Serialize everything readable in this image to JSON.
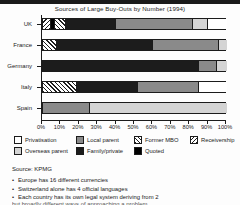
{
  "chart_data": {
    "type": "bar",
    "orientation": "horizontal",
    "stacked": true,
    "normalized_percent": true,
    "title": "Sources of Large Buy-Outs by Number (1994)",
    "xlabel": "",
    "ylabel": "",
    "xlim": [
      0,
      100
    ],
    "grid": false,
    "legend_position": "bottom",
    "categories": [
      "UK",
      "France",
      "Germany",
      "Italy",
      "Spain"
    ],
    "tick_labels": [
      "0%",
      "10%",
      "20%",
      "30%",
      "40%",
      "50%",
      "60%",
      "70%",
      "80%",
      "90%",
      "100%"
    ],
    "tick_values": [
      0,
      10,
      20,
      30,
      40,
      50,
      60,
      70,
      80,
      90,
      100
    ],
    "series": [
      {
        "name": "Receivership",
        "key": "recv",
        "fill": "hatch-back",
        "values": [
          4,
          0,
          0,
          0,
          0
        ]
      },
      {
        "name": "Quoted",
        "key": "quoted",
        "fill": "#000000",
        "values": [
          2,
          0,
          0,
          0,
          0
        ]
      },
      {
        "name": "Former MBO",
        "key": "mbo",
        "fill": "hatch-forward",
        "values": [
          6,
          7,
          0,
          18,
          0
        ]
      },
      {
        "name": "Family/private",
        "key": "fam",
        "fill": "#1c1c1c",
        "values": [
          27,
          52,
          84,
          33,
          0
        ]
      },
      {
        "name": "Local parent",
        "key": "local",
        "fill": "#8a8a8a",
        "values": [
          42,
          36,
          10,
          33,
          25
        ]
      },
      {
        "name": "Overseas parent",
        "key": "over",
        "fill": "#d4d4d4",
        "values": [
          8,
          5,
          6,
          0,
          75
        ]
      },
      {
        "name": "Privatisation",
        "key": "priv",
        "fill": "#ffffff",
        "values": [
          11,
          0,
          0,
          16,
          0
        ]
      }
    ],
    "bars": [
      {
        "category": "UK",
        "segments": [
          {
            "key": "recv",
            "label": "Receivership",
            "start": 0,
            "end": 4
          },
          {
            "key": "quoted",
            "label": "Quoted",
            "start": 4,
            "end": 6
          },
          {
            "key": "mbo",
            "label": "Former MBO",
            "start": 6,
            "end": 12
          },
          {
            "key": "fam",
            "label": "Family/private",
            "start": 12,
            "end": 39
          },
          {
            "key": "local",
            "label": "Local parent",
            "start": 39,
            "end": 81
          },
          {
            "key": "over",
            "label": "Overseas parent",
            "start": 81,
            "end": 89
          },
          {
            "key": "priv",
            "label": "Privatisation",
            "start": 89,
            "end": 100
          }
        ]
      },
      {
        "category": "France",
        "segments": [
          {
            "key": "mbo",
            "label": "Former MBO",
            "start": 0,
            "end": 7
          },
          {
            "key": "fam",
            "label": "Family/private",
            "start": 7,
            "end": 59
          },
          {
            "key": "local",
            "label": "Local parent",
            "start": 59,
            "end": 95
          },
          {
            "key": "over",
            "label": "Overseas parent",
            "start": 95,
            "end": 100
          }
        ]
      },
      {
        "category": "Germany",
        "segments": [
          {
            "key": "fam",
            "label": "Family/private",
            "start": 0,
            "end": 84
          },
          {
            "key": "local",
            "label": "Local parent",
            "start": 84,
            "end": 94
          },
          {
            "key": "over",
            "label": "Overseas parent",
            "start": 94,
            "end": 100
          }
        ]
      },
      {
        "category": "Italy",
        "segments": [
          {
            "key": "mbo",
            "label": "Former MBO",
            "start": 0,
            "end": 18
          },
          {
            "key": "fam",
            "label": "Family/private",
            "start": 18,
            "end": 51
          },
          {
            "key": "local",
            "label": "Local parent",
            "start": 51,
            "end": 84
          },
          {
            "key": "priv",
            "label": "Privatisation",
            "start": 84,
            "end": 100
          }
        ]
      },
      {
        "category": "Spain",
        "segments": [
          {
            "key": "local",
            "label": "Local parent",
            "start": 0,
            "end": 25
          },
          {
            "key": "over",
            "label": "Overseas parent",
            "start": 25,
            "end": 100
          }
        ]
      }
    ]
  },
  "legend": {
    "items": [
      {
        "label": "Privatisation",
        "key": "priv"
      },
      {
        "label": "Local parent",
        "key": "local"
      },
      {
        "label": "Former MBO",
        "key": "mbo"
      },
      {
        "label": "Receivership",
        "key": "recv"
      },
      {
        "label": "Overseas parent",
        "key": "over"
      },
      {
        "label": "Family/private",
        "key": "fam"
      },
      {
        "label": "Quoted",
        "key": "quoted"
      }
    ]
  },
  "source": {
    "text": "Source: KPMG"
  },
  "notes": {
    "bullet": "•",
    "items": [
      "Europe has 16 different currencies",
      "Switzerland alone has 4 official languages",
      "Each country has its own legal system deriving from 2"
    ],
    "clipped": "but broadly different ways of approaching a problem"
  }
}
